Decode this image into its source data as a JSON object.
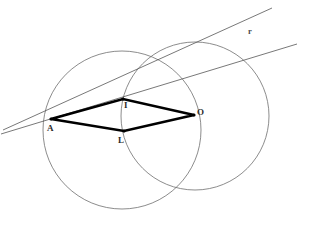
{
  "canvas": {
    "width": 313,
    "height": 225,
    "background": "#ffffff"
  },
  "style": {
    "circle_stroke": "#6e6e6e",
    "circle_stroke_width": 0.8,
    "thin_line_stroke": "#555555",
    "thin_line_stroke_width": 0.8,
    "rhombus_stroke": "#000000",
    "rhombus_stroke_width": 2.6,
    "label_color": "#2b2b2b"
  },
  "circles": [
    {
      "name": "left-circle",
      "cx": 122,
      "cy": 130,
      "r": 79
    },
    {
      "name": "right-circle",
      "cx": 195,
      "cy": 116,
      "r": 74
    }
  ],
  "points": [
    {
      "id": "A",
      "label": "A",
      "x": 51,
      "y": 119,
      "label_x": 47,
      "label_y": 124
    },
    {
      "id": "I",
      "label": "I",
      "x": 123,
      "y": 99,
      "label_x": 124,
      "label_y": 101
    },
    {
      "id": "L",
      "label": "L",
      "x": 124,
      "y": 131,
      "label_x": 118,
      "label_y": 136
    },
    {
      "id": "O",
      "label": "O",
      "x": 194,
      "y": 115,
      "label_x": 197,
      "label_y": 108
    }
  ],
  "polygon": {
    "name": "rhombus-AILO",
    "vertices": [
      "A",
      "I",
      "O",
      "L"
    ],
    "path": "51,119 123,99 194,115 124,131"
  },
  "lines": [
    {
      "id": "r",
      "label": "r",
      "x1": 3,
      "y1": 130,
      "x2": 272,
      "y2": 8,
      "label_x": 248,
      "label_y": 27
    },
    {
      "id": "s",
      "label": "",
      "x1": 1,
      "y1": 134,
      "x2": 297,
      "y2": 44,
      "label_x": 0,
      "label_y": 0
    }
  ]
}
